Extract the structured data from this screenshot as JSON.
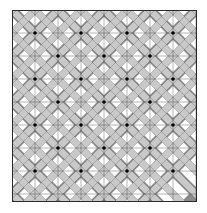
{
  "diagram": {
    "type": "quilt-pattern",
    "grid": {
      "origin_x": 12,
      "origin_y": 10,
      "width": 185,
      "height": 192,
      "unit": 23,
      "tile": 46,
      "columns": 8,
      "rows": 8
    },
    "star_points": [
      [
        35,
        33
      ],
      [
        81,
        33
      ],
      [
        127,
        33
      ],
      [
        173,
        33
      ],
      [
        35,
        79
      ],
      [
        81,
        79
      ],
      [
        127,
        79
      ],
      [
        173,
        79
      ],
      [
        35,
        125
      ],
      [
        81,
        125
      ],
      [
        127,
        125
      ],
      [
        173,
        125
      ],
      [
        35,
        171
      ],
      [
        81,
        171
      ],
      [
        127,
        171
      ],
      [
        173,
        171
      ]
    ],
    "cross_points": [
      [
        58,
        56
      ],
      [
        104,
        56
      ],
      [
        150,
        56
      ],
      [
        58,
        102
      ],
      [
        104,
        102
      ],
      [
        150,
        102
      ],
      [
        58,
        148
      ],
      [
        104,
        148
      ],
      [
        150,
        148
      ]
    ],
    "colors": {
      "background": "#ffffff",
      "dark_fabric": "#8a8a8a",
      "light_fabric": "#c9c9c9",
      "white_fabric": "#ffffff",
      "seam_line": "#2a2a2a",
      "vertex_dot": "#000000"
    }
  }
}
